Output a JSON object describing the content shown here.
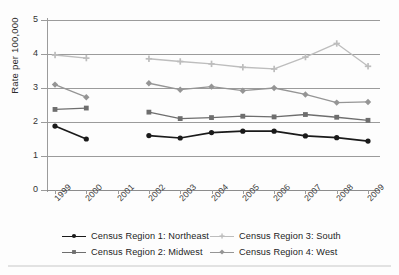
{
  "figure": {
    "background_color": "#fdfdfd",
    "bottom_rule_color": "#e2e2e2"
  },
  "axes": {
    "y_title": "Rate per 100,000",
    "y_ticks": [
      "0",
      "1",
      "2",
      "3",
      "4",
      "5"
    ],
    "x_ticks": [
      "1999",
      "2000",
      "2001",
      "2002",
      "2003",
      "2004",
      "2005",
      "2006",
      "2007",
      "2008",
      "2009"
    ]
  },
  "legend": {
    "position": "bottom",
    "items": [
      {
        "label": "Census Region 1: Northeast",
        "color": "#1a1a1a",
        "marker": "circle"
      },
      {
        "label": "Census Region 3: South",
        "color": "#bdbdbd",
        "marker": "plus"
      },
      {
        "label": "Census Region 2: Midwest",
        "color": "#6e6e6e",
        "marker": "square"
      },
      {
        "label": "Census Region 4: West",
        "color": "#959595",
        "marker": "diamond"
      }
    ]
  },
  "chart_data": {
    "type": "line",
    "title": "",
    "xlabel": "",
    "ylabel": "Rate per 100,000",
    "x": [
      1999,
      2000,
      2001,
      2002,
      2003,
      2004,
      2005,
      2006,
      2007,
      2008,
      2009
    ],
    "categories": [
      "1999",
      "2000",
      "2001",
      "2002",
      "2003",
      "2004",
      "2005",
      "2006",
      "2007",
      "2008",
      "2009"
    ],
    "ylim": [
      0,
      5
    ],
    "yticks": [
      0,
      1,
      2,
      3,
      4,
      5
    ],
    "grid": "horizontal",
    "legend_position": "bottom",
    "note": "No data plotted for 2001; each series is broken between 2000 and 2002",
    "series": [
      {
        "name": "Census Region 1: Northeast",
        "color": "#1a1a1a",
        "marker": "circle",
        "values": [
          1.88,
          1.5,
          null,
          1.6,
          1.53,
          1.69,
          1.73,
          1.73,
          1.59,
          1.54,
          1.44
        ]
      },
      {
        "name": "Census Region 2: Midwest",
        "color": "#6e6e6e",
        "marker": "square",
        "values": [
          2.37,
          2.41,
          null,
          2.29,
          2.1,
          2.13,
          2.17,
          2.15,
          2.22,
          2.14,
          2.05
        ]
      },
      {
        "name": "Census Region 3: South",
        "color": "#bdbdbd",
        "marker": "plus",
        "values": [
          3.97,
          3.88,
          null,
          3.86,
          3.78,
          3.71,
          3.61,
          3.56,
          3.91,
          4.31,
          3.64
        ]
      },
      {
        "name": "Census Region 4: West",
        "color": "#959595",
        "marker": "diamond",
        "values": [
          3.1,
          2.73,
          null,
          3.14,
          2.95,
          3.04,
          2.92,
          3.0,
          2.81,
          2.57,
          2.59
        ]
      }
    ]
  }
}
